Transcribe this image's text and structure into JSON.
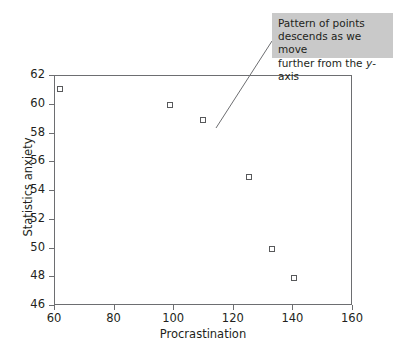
{
  "chart_data": {
    "type": "scatter",
    "title": "",
    "xlabel": "Procrastination",
    "ylabel": "Statistics anxiety",
    "xlim": [
      60,
      160
    ],
    "ylim": [
      46,
      62
    ],
    "xticks": [
      60,
      80,
      100,
      120,
      140,
      160
    ],
    "yticks": [
      46,
      48,
      50,
      52,
      54,
      56,
      58,
      60,
      62
    ],
    "xtick_labels": [
      "60",
      "80",
      "100",
      "120",
      "140",
      "160"
    ],
    "ytick_labels": [
      "46",
      "48",
      "50",
      "52",
      "54",
      "56",
      "58",
      "60",
      "62"
    ],
    "grid": false,
    "legend": null,
    "marker": "open-square",
    "marker_color": "#58595b",
    "series": [
      {
        "name": "Procrastination vs Statistics anxiety",
        "points": [
          {
            "x": 62,
            "y": 61.0
          },
          {
            "x": 99,
            "y": 59.9
          },
          {
            "x": 110,
            "y": 58.9
          },
          {
            "x": 125.5,
            "y": 54.9
          },
          {
            "x": 133,
            "y": 49.9
          },
          {
            "x": 140.5,
            "y": 47.9
          }
        ]
      }
    ],
    "annotations": [
      {
        "id": "trend-callout",
        "line1": "Pattern of points",
        "line2": "descends as we move",
        "line3_prefix": "further from the ",
        "line3_italic": "y",
        "line3_suffix": "-axis",
        "background": "#c9c9c9",
        "leader_from": {
          "x": 272,
          "y": 41
        },
        "leader_to": {
          "x": 216,
          "y": 128
        }
      }
    ]
  },
  "figure": {
    "background": "#ffffff",
    "frame_color": "#6d6e71",
    "text_color": "#231f20"
  }
}
